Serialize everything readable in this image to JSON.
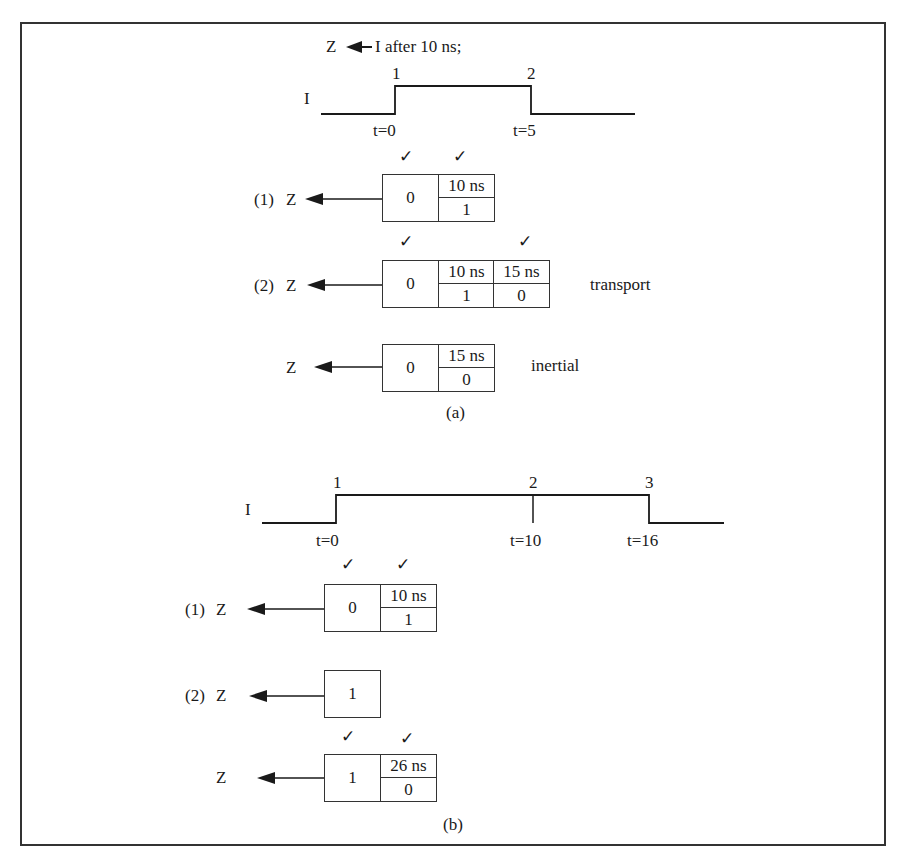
{
  "figure": {
    "statement": "Z ◀ I after 10 ns;",
    "statement_lhs": "Z",
    "statement_rhs": "I after 10 ns;",
    "check_glyph": "✓"
  },
  "part_a": {
    "caption": "(a)",
    "waveform": {
      "signal_label": "I",
      "events": [
        {
          "label": "1",
          "time": "t=0"
        },
        {
          "label": "2",
          "time": "t=5"
        }
      ]
    },
    "drivers": [
      {
        "prefix": "(1)",
        "target": "Z",
        "current": "0",
        "transactions": [
          {
            "time": "10 ns",
            "value": "1"
          }
        ],
        "note": ""
      },
      {
        "prefix": "(2)",
        "target": "Z",
        "current": "0",
        "transactions": [
          {
            "time": "10 ns",
            "value": "1"
          },
          {
            "time": "15 ns",
            "value": "0"
          }
        ],
        "note": "transport"
      },
      {
        "prefix": "",
        "target": "Z",
        "current": "0",
        "transactions": [
          {
            "time": "15 ns",
            "value": "0"
          }
        ],
        "note": "inertial"
      }
    ]
  },
  "part_b": {
    "caption": "(b)",
    "waveform": {
      "signal_label": "I",
      "events": [
        {
          "label": "1",
          "time": "t=0"
        },
        {
          "label": "2",
          "time": "t=10"
        },
        {
          "label": "3",
          "time": "t=16"
        }
      ]
    },
    "drivers": [
      {
        "prefix": "(1)",
        "target": "Z",
        "current": "0",
        "transactions": [
          {
            "time": "10 ns",
            "value": "1"
          }
        ]
      },
      {
        "prefix": "(2)",
        "target": "Z",
        "current": "1",
        "transactions": []
      },
      {
        "prefix": "",
        "target": "Z",
        "current": "1",
        "transactions": [
          {
            "time": "26 ns",
            "value": "0"
          }
        ]
      }
    ]
  }
}
